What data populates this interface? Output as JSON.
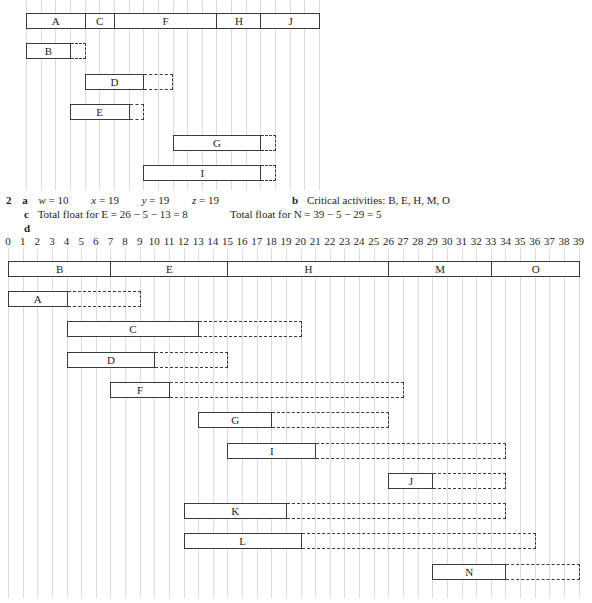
{
  "chart_data": [
    {
      "type": "gantt",
      "title": "",
      "x_range": [
        0,
        20
      ],
      "grid": true,
      "critical_path": [
        {
          "label": "A",
          "start": 0,
          "end": 4
        },
        {
          "label": "C",
          "start": 4,
          "end": 6
        },
        {
          "label": "F",
          "start": 6,
          "end": 13
        },
        {
          "label": "H",
          "start": 13,
          "end": 16
        },
        {
          "label": "J",
          "start": 16,
          "end": 20
        }
      ],
      "activities": [
        {
          "label": "B",
          "start": 0,
          "end": 3,
          "float_end": 4
        },
        {
          "label": "D",
          "start": 4,
          "end": 8,
          "float_end": 10
        },
        {
          "label": "E",
          "start": 3,
          "end": 7,
          "float_end": 8
        },
        {
          "label": "G",
          "start": 10,
          "end": 16,
          "float_end": 17
        },
        {
          "label": "I",
          "start": 8,
          "end": 16,
          "float_end": 17
        }
      ]
    },
    {
      "type": "gantt",
      "title": "",
      "x_range": [
        0,
        39
      ],
      "grid": true,
      "tick_labels": [
        "0",
        "1",
        "2",
        "3",
        "4",
        "5",
        "6",
        "7",
        "8",
        "9",
        "10",
        "11",
        "12",
        "13",
        "14",
        "15",
        "16",
        "17",
        "18",
        "19",
        "20",
        "21",
        "22",
        "23",
        "24",
        "25",
        "26",
        "27",
        "28",
        "29",
        "30",
        "31",
        "32",
        "33",
        "34",
        "35",
        "36",
        "37",
        "38",
        "39"
      ],
      "critical_path": [
        {
          "label": "B",
          "start": 0,
          "end": 7
        },
        {
          "label": "E",
          "start": 7,
          "end": 15
        },
        {
          "label": "H",
          "start": 15,
          "end": 26
        },
        {
          "label": "M",
          "start": 26,
          "end": 33
        },
        {
          "label": "O",
          "start": 33,
          "end": 39
        }
      ],
      "activities": [
        {
          "label": "A",
          "start": 0,
          "end": 4,
          "float_end": 9
        },
        {
          "label": "C",
          "start": 4,
          "end": 13,
          "float_end": 20
        },
        {
          "label": "D",
          "start": 4,
          "end": 10,
          "float_end": 15
        },
        {
          "label": "F",
          "start": 7,
          "end": 11,
          "float_end": 27
        },
        {
          "label": "G",
          "start": 13,
          "end": 18,
          "float_end": 26
        },
        {
          "label": "I",
          "start": 15,
          "end": 21,
          "float_end": 34
        },
        {
          "label": "J",
          "start": 26,
          "end": 29,
          "float_end": 34
        },
        {
          "label": "K",
          "start": 12,
          "end": 19,
          "float_end": 34
        },
        {
          "label": "L",
          "start": 12,
          "end": 20,
          "float_end": 36
        },
        {
          "label": "N",
          "start": 29,
          "end": 34,
          "float_end": 39
        }
      ]
    }
  ],
  "answers": {
    "question_number": "2",
    "a": {
      "label": "a",
      "w": "w",
      "w_val": " = 10",
      "x": "x",
      "x_val": " = 19",
      "y": "y",
      "y_val": " = 19",
      "z": "z",
      "z_val": " = 19"
    },
    "b": {
      "label": "b",
      "text": "Critical activities: B, E, H, M, O"
    },
    "c": {
      "label": "c",
      "text_e": "Total float for E = 26 − 5 − 13 = 8",
      "text_n": "Total float for N = 39 − 5 − 29 = 5"
    },
    "d": {
      "label": "d"
    }
  }
}
